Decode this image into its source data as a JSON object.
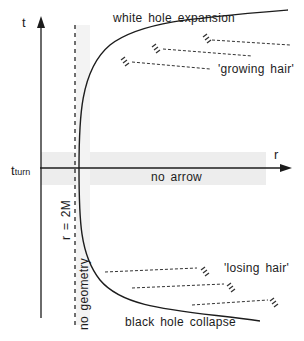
{
  "diagram": {
    "axes": {
      "t_label": "t",
      "r_label": "r",
      "t_turn_main": "t",
      "t_turn_sub": "turn"
    },
    "labels": {
      "white_hole": "white hole expansion",
      "black_hole": "black hole collapse",
      "growing_hair": "'growing hair'",
      "losing_hair": "'losing hair'",
      "no_arrow": "no arrow",
      "horizon": "r = 2M",
      "no_geometry": "no geometry"
    },
    "colors": {
      "ink": "#1c1c1c",
      "shade": "#ececec",
      "background": "#ffffff"
    }
  }
}
